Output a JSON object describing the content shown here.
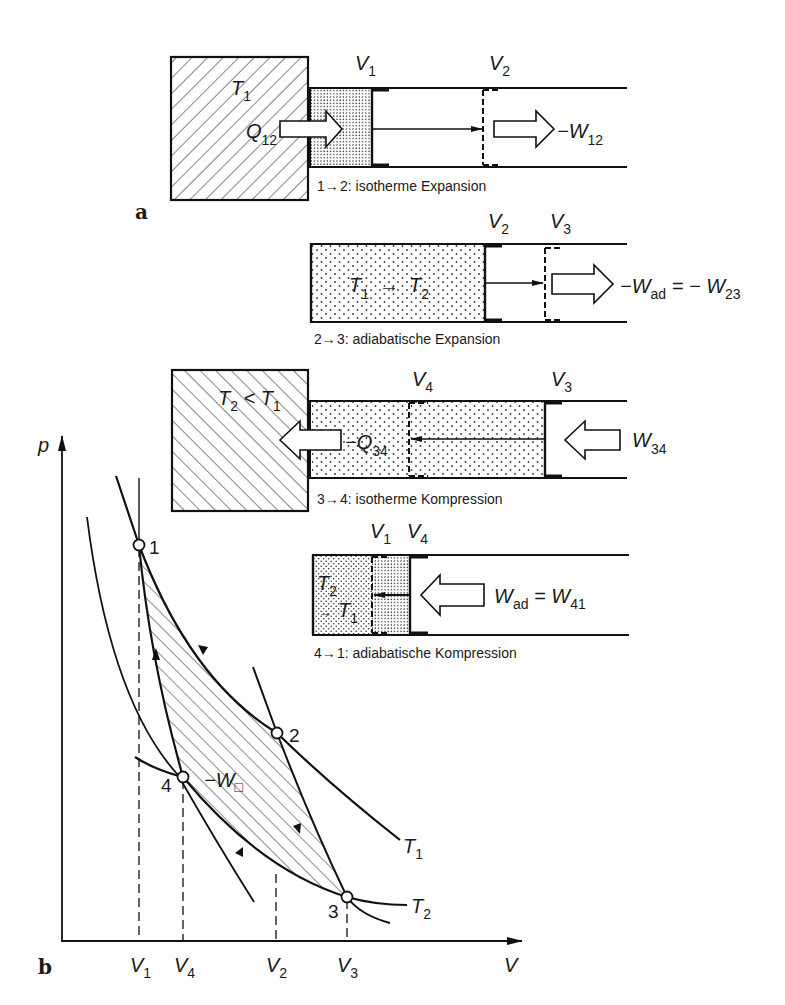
{
  "figure": {
    "panel_a_label": "a",
    "panel_b_label": "b",
    "steps": [
      {
        "id": "1-2",
        "caption": "1→ 2: isotherme Expansion",
        "reservoir_label": "T",
        "reservoir_sub": "1",
        "volume_labels": [
          {
            "main": "V",
            "sub": "1"
          },
          {
            "main": "V",
            "sub": "2"
          }
        ],
        "heat_label": {
          "main": "Q",
          "sub": "12"
        },
        "work_label": {
          "main": "−W",
          "sub": "12"
        }
      },
      {
        "id": "2-3",
        "caption": "2→ 3: adiabatische Expansion",
        "gas_label": {
          "t1": "T",
          "t1sub": "1",
          "arrow": "→",
          "t2": "T",
          "t2sub": "2"
        },
        "volume_labels": [
          {
            "main": "V",
            "sub": "2"
          },
          {
            "main": "V",
            "sub": "3"
          }
        ],
        "work_label": {
          "main": "−W",
          "sub": "ad",
          "eq": " = − W",
          "eqsub": "23"
        }
      },
      {
        "id": "3-4",
        "caption": "3→ 4: isotherme Kompression",
        "reservoir_label": "T",
        "reservoir_sub": "2",
        "reservoir_rel": " < T",
        "reservoir_rel_sub": "1",
        "volume_labels": [
          {
            "main": "V",
            "sub": "4"
          },
          {
            "main": "V",
            "sub": "3"
          }
        ],
        "heat_label": {
          "main": "−Q",
          "sub": "34"
        },
        "work_label": {
          "main": "W",
          "sub": "34"
        }
      },
      {
        "id": "4-1",
        "caption": "4→ 1: adiabatische Kompression",
        "gas_label": {
          "t2": "T",
          "t2sub": "2",
          "arrow": "→",
          "t1": "T",
          "t1sub": "1"
        },
        "volume_labels": [
          {
            "main": "V",
            "sub": "1"
          },
          {
            "main": "V",
            "sub": "4"
          }
        ],
        "work_label": {
          "main": "W",
          "sub": "ad",
          "eq": " = W",
          "eqsub": "41"
        }
      }
    ],
    "pv_diagram": {
      "y_axis_label": "p",
      "x_axis_label": "V",
      "points": [
        {
          "label": "1",
          "V": "V1"
        },
        {
          "label": "2",
          "V": "V2"
        },
        {
          "label": "3",
          "V": "V3"
        },
        {
          "label": "4",
          "V": "V4"
        }
      ],
      "x_ticks": [
        {
          "main": "V",
          "sub": "1"
        },
        {
          "main": "V",
          "sub": "4"
        },
        {
          "main": "V",
          "sub": "2"
        },
        {
          "main": "V",
          "sub": "3"
        }
      ],
      "isotherms": [
        {
          "main": "T",
          "sub": "1"
        },
        {
          "main": "T",
          "sub": "2"
        }
      ],
      "work_area_label": {
        "main": "−W",
        "sub": "□"
      }
    }
  }
}
